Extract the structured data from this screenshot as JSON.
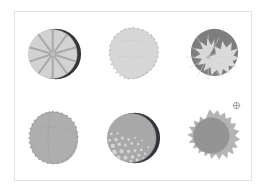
{
  "panel": {
    "background_color": "#ffffff",
    "border_color": "#e4e4e4",
    "caption": ""
  },
  "marker": {
    "name": "crosshair-target-marker",
    "glyph": "⊕",
    "color": "#8a8a8a"
  },
  "palette": {
    "light_gray": "#c9c9c9",
    "lighter_gray": "#d6d6d6",
    "pale_gray": "#dcdcdc",
    "mid_gray": "#a8a8a8",
    "mid_gray_2": "#9f9f9f",
    "dark_gray": "#8c8c8c",
    "darker_gray": "#7a7a7a",
    "near_black": "#2b2b2e",
    "shadow_gray": "#4a4a50",
    "outline": "#b5b5b5"
  },
  "figures": [
    {
      "id": "figure-1",
      "position": "row-1-col-1",
      "label": "spoked-disc-with-dark-crescent",
      "description": "Light gray disc with ten radial spokes and a dark crescent shadow on the upper right",
      "body_color": "#d2d2d2",
      "spoke_color": "#a9a9a9",
      "crescent_color": "#2b2b2e",
      "spokes": 10
    },
    {
      "id": "figure-2",
      "position": "row-1-col-2",
      "label": "stippled-polygon-blob",
      "description": "Pale gray rounded polygon with a stippled dotted rim",
      "body_color": "#d6d6d6",
      "rim_color": "#b0b0b0",
      "rim_dots": 46
    },
    {
      "id": "figure-3",
      "position": "row-1-col-3",
      "label": "starburst-over-dark-disc",
      "description": "Dark gray disc with a pale spiky starburst overlapping to the lower left",
      "body_color": "#7e7e7e",
      "burst_color": "#dadada",
      "burst_points": 32
    },
    {
      "id": "figure-4",
      "position": "row-2-col-1",
      "label": "scalloped-oval-blob",
      "description": "Medium gray oval blob with a finely scalloped edge and faint vertical seam",
      "body_color": "#aeaeae",
      "edge_color": "#9b9b9b",
      "scallops": 52
    },
    {
      "id": "figure-5",
      "position": "row-2-col-2",
      "label": "vacuolated-disc-with-crescent",
      "description": "Gray disc with pale bubble vacuoles in the lower left and a dark crescent at upper right",
      "body_color": "#a8a8a8",
      "vacuole_color": "#d4d4d4",
      "crescent_color": "#2b2b2e",
      "vacuoles": 28
    },
    {
      "id": "figure-6",
      "position": "row-2-col-3",
      "label": "spiky-halo-disc",
      "description": "Darker gray core disc surrounded by a lighter spiky halo",
      "core_color": "#949494",
      "halo_color": "#b4b4b4",
      "spikes": 34
    }
  ]
}
